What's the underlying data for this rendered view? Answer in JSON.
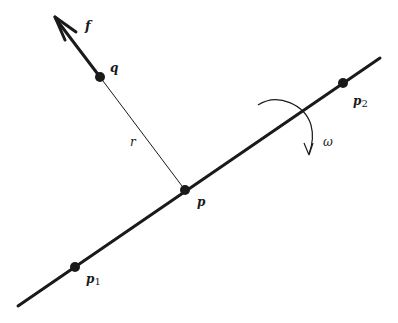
{
  "diagram": {
    "colors": {
      "ink": "#1a1a1a",
      "background": "#ffffff"
    },
    "axis_line": {
      "from": [
        18,
        306
      ],
      "to": [
        380,
        58
      ]
    },
    "points": [
      {
        "id": "p1",
        "label": "p",
        "subscript": "1",
        "pos": [
          75,
          267
        ],
        "label_pos": [
          86,
          283
        ]
      },
      {
        "id": "p",
        "label": "p",
        "subscript": "",
        "pos": [
          185,
          190
        ],
        "label_pos": [
          197,
          206
        ]
      },
      {
        "id": "p2",
        "label": "p",
        "subscript": "2",
        "pos": [
          343,
          83
        ],
        "label_pos": [
          353,
          105
        ]
      },
      {
        "id": "q",
        "label": "q",
        "subscript": "",
        "pos": [
          100,
          77
        ],
        "label_pos": [
          110,
          72
        ]
      }
    ],
    "segment_r": {
      "label": "r",
      "from": [
        100,
        77
      ],
      "to": [
        185,
        190
      ],
      "label_pos": [
        130,
        146
      ]
    },
    "force": {
      "label": "f",
      "from": [
        100,
        77
      ],
      "tip": [
        54,
        16
      ],
      "label_pos": [
        85,
        30
      ]
    },
    "rotation": {
      "label": "ω",
      "label_pos": [
        323,
        146
      ]
    }
  }
}
